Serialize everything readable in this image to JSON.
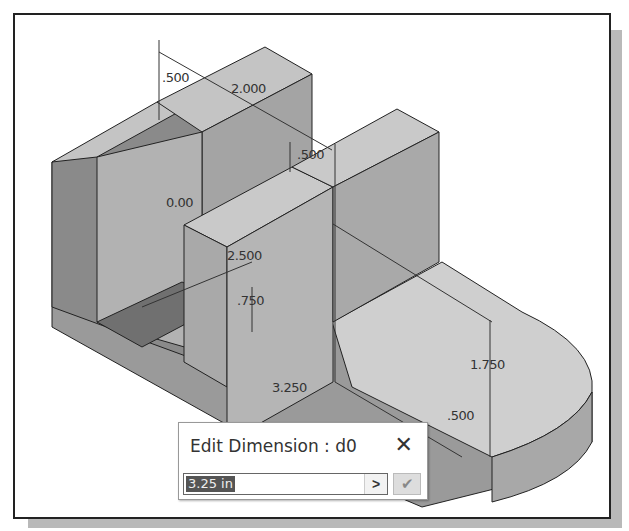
{
  "viewport": {
    "description": "Isometric 3D part with dimensions"
  },
  "dimensions": {
    "d_top_left": ".500",
    "d_top_width": "2.000",
    "d_mid": ".500",
    "d_angle": "0.00",
    "d_height": "2.500",
    "d_slot": ".750",
    "d_right_height": "1.750",
    "d_length": "3.250",
    "d_bottom": ".500"
  },
  "dialog": {
    "title": "Edit Dimension : d0",
    "close_icon": "close-icon",
    "value": "3.25 in",
    "arrow_label": ">",
    "ok_icon": "checkmark-icon"
  }
}
